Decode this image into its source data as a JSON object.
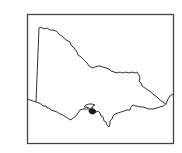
{
  "map": {
    "subject": "Victoria, Australia outline",
    "highlighted_region": "Melbourne area (filled)",
    "colors": {
      "background": "#ffffff",
      "outline": "#333333",
      "frame": "#444444",
      "highlight": "#1a1a1a"
    }
  }
}
